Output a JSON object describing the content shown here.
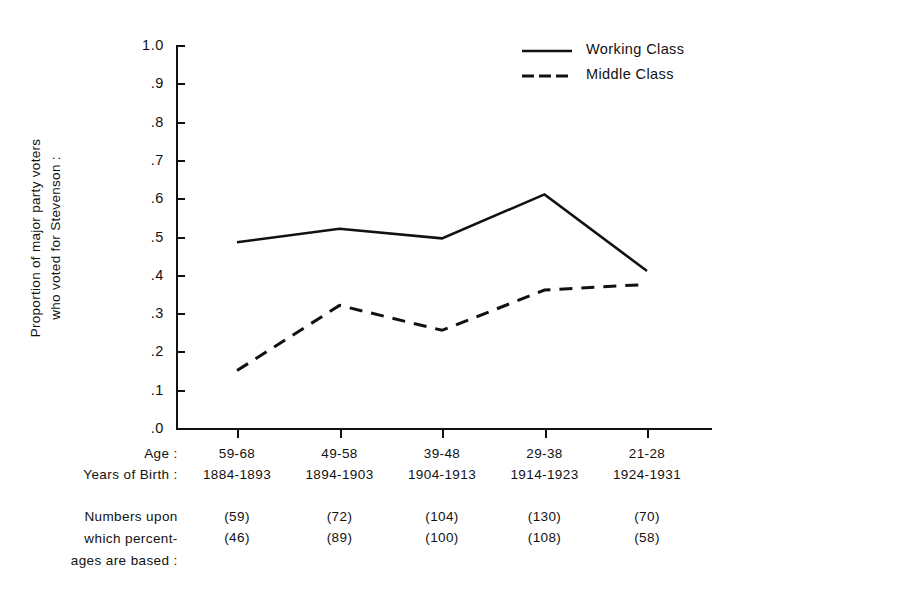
{
  "chart_data": {
    "type": "line",
    "title": "",
    "xlabel": "",
    "ylabel": "Proportion of major party voters who voted for Stevenson :",
    "ylim": [
      0,
      1.0
    ],
    "ytick_labels": [
      "1.0",
      ".9",
      ".8",
      ".7",
      ".6",
      ".5",
      ".4",
      ".3",
      ".2",
      ".1",
      ".0"
    ],
    "ytick_values": [
      1.0,
      0.9,
      0.8,
      0.7,
      0.6,
      0.5,
      0.4,
      0.3,
      0.2,
      0.1,
      0.0
    ],
    "categories": [
      "59-68",
      "49-58",
      "39-48",
      "29-38",
      "21-28"
    ],
    "grid": false,
    "legend_position": "top-right",
    "series": [
      {
        "name": "Working Class",
        "style": "solid",
        "values": [
          0.485,
          0.52,
          0.495,
          0.61,
          0.41
        ],
        "n": [
          59,
          72,
          104,
          130,
          70
        ]
      },
      {
        "name": "Middle Class",
        "style": "dashed",
        "values": [
          0.15,
          0.32,
          0.255,
          0.36,
          0.375
        ],
        "n": [
          46,
          89,
          100,
          108,
          58
        ]
      }
    ]
  },
  "axis": {
    "y_title_line1": "Proportion of major party voters",
    "y_title_line2": "who voted for Stevenson :"
  },
  "legend": {
    "items": [
      {
        "label": "Working Class",
        "style": "solid"
      },
      {
        "label": "Middle Class",
        "style": "dashed"
      }
    ]
  },
  "bottom": {
    "age_label": "Age :",
    "birth_label": "Years of Birth :",
    "age_values": [
      "59-68",
      "49-58",
      "39-48",
      "29-38",
      "21-28"
    ],
    "birth_values": [
      "1884-1893",
      "1894-1903",
      "1904-1913",
      "1914-1923",
      "1924-1931"
    ],
    "numbers_label_line1": "Numbers upon",
    "numbers_label_line2": "which percent-",
    "numbers_label_line3": "ages are based :",
    "working_counts": [
      "(59)",
      "(72)",
      "(104)",
      "(130)",
      "(70)"
    ],
    "middle_counts": [
      "(46)",
      "(89)",
      "(100)",
      "(108)",
      "(58)"
    ]
  },
  "colors": {
    "ink": "#111111",
    "background": "#ffffff"
  }
}
